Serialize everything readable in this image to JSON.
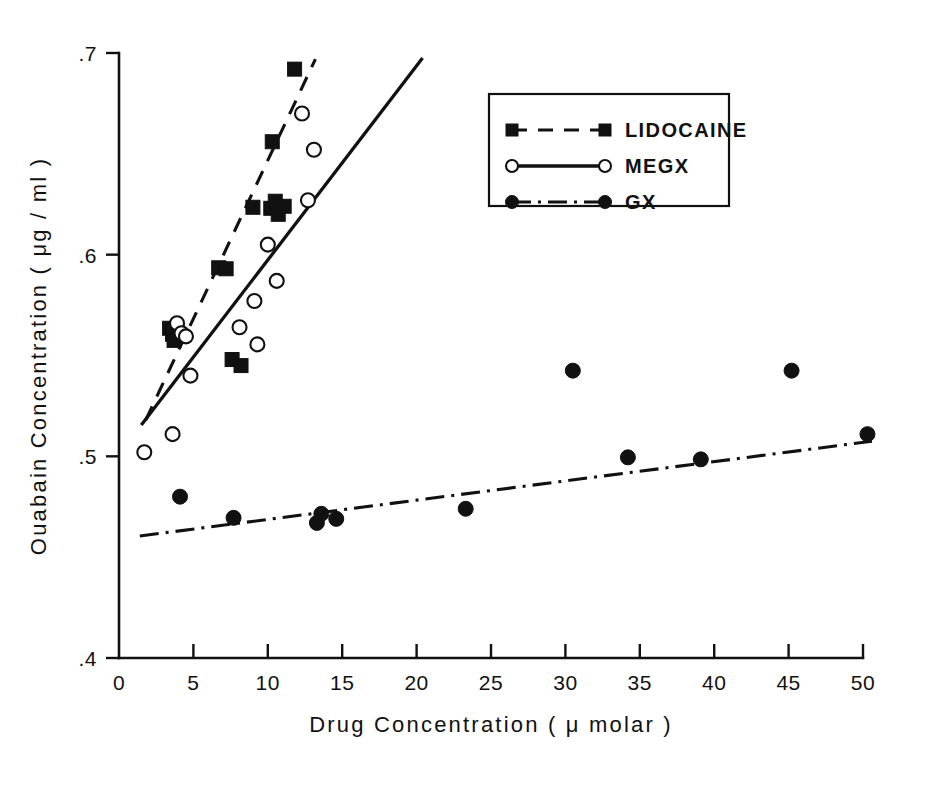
{
  "chart_data": {
    "type": "scatter",
    "title": "",
    "xlabel": "Drug Concentration ( μ molar )",
    "ylabel": "Ouabain Concentration ( μg / ml )",
    "xlim": [
      0,
      50
    ],
    "ylim": [
      0.4,
      0.7
    ],
    "xticks": [
      0,
      5,
      10,
      15,
      20,
      25,
      30,
      35,
      40,
      45,
      50
    ],
    "xtick_labels": [
      "0",
      "5",
      "10",
      "15",
      "20",
      "25",
      "30",
      "35",
      "40",
      "45",
      "50"
    ],
    "yticks": [
      0.4,
      0.5,
      0.6,
      0.7
    ],
    "ytick_labels": [
      ".4",
      ".5",
      ".6",
      ".7"
    ],
    "grid": false,
    "legend_position": "upper-right",
    "series": [
      {
        "name": "LIDOCAINE",
        "marker": "filled-square",
        "line_style": "dashed",
        "color": "#111111",
        "points": [
          {
            "x": 3.4,
            "y": 0.5635
          },
          {
            "x": 3.6,
            "y": 0.5605
          },
          {
            "x": 3.7,
            "y": 0.5575
          },
          {
            "x": 3.9,
            "y": 0.5615
          },
          {
            "x": 6.7,
            "y": 0.5935
          },
          {
            "x": 7.2,
            "y": 0.593
          },
          {
            "x": 7.6,
            "y": 0.548
          },
          {
            "x": 8.2,
            "y": 0.545
          },
          {
            "x": 9.0,
            "y": 0.6235
          },
          {
            "x": 10.2,
            "y": 0.623
          },
          {
            "x": 10.5,
            "y": 0.6265
          },
          {
            "x": 10.7,
            "y": 0.62
          },
          {
            "x": 11.1,
            "y": 0.624
          },
          {
            "x": 10.3,
            "y": 0.656
          },
          {
            "x": 11.8,
            "y": 0.692
          }
        ],
        "fit_line": {
          "x1": 1.8,
          "y1": 0.518,
          "x2": 13.2,
          "y2": 0.697
        }
      },
      {
        "name": "MEGX",
        "marker": "open-circle",
        "line_style": "solid",
        "color": "#111111",
        "points": [
          {
            "x": 1.7,
            "y": 0.502
          },
          {
            "x": 3.6,
            "y": 0.511
          },
          {
            "x": 3.9,
            "y": 0.566
          },
          {
            "x": 4.2,
            "y": 0.561
          },
          {
            "x": 4.5,
            "y": 0.5595
          },
          {
            "x": 4.8,
            "y": 0.54
          },
          {
            "x": 8.1,
            "y": 0.564
          },
          {
            "x": 9.3,
            "y": 0.5555
          },
          {
            "x": 9.1,
            "y": 0.577
          },
          {
            "x": 10.0,
            "y": 0.605
          },
          {
            "x": 10.6,
            "y": 0.587
          },
          {
            "x": 12.3,
            "y": 0.67
          },
          {
            "x": 13.1,
            "y": 0.652
          },
          {
            "x": 12.7,
            "y": 0.627
          }
        ],
        "fit_line": {
          "x1": 1.5,
          "y1": 0.5155,
          "x2": 20.4,
          "y2": 0.6975
        }
      },
      {
        "name": "GX",
        "marker": "filled-circle",
        "line_style": "dash-dot",
        "color": "#111111",
        "points": [
          {
            "x": 4.1,
            "y": 0.48
          },
          {
            "x": 7.7,
            "y": 0.4695
          },
          {
            "x": 13.3,
            "y": 0.467
          },
          {
            "x": 13.6,
            "y": 0.4715
          },
          {
            "x": 14.6,
            "y": 0.469
          },
          {
            "x": 23.3,
            "y": 0.474
          },
          {
            "x": 30.5,
            "y": 0.5425
          },
          {
            "x": 34.2,
            "y": 0.4995
          },
          {
            "x": 39.1,
            "y": 0.4985
          },
          {
            "x": 45.2,
            "y": 0.5425
          },
          {
            "x": 50.3,
            "y": 0.511
          }
        ],
        "fit_line": {
          "x1": 1.4,
          "y1": 0.4605,
          "x2": 50.6,
          "y2": 0.5075
        }
      }
    ]
  },
  "legend": {
    "items": [
      {
        "label": "LIDOCAINE",
        "marker": "filled-square",
        "line_style": "dashed"
      },
      {
        "label": "MEGX",
        "marker": "open-circle",
        "line_style": "solid"
      },
      {
        "label": "GX",
        "marker": "filled-circle",
        "line_style": "dash-dot"
      }
    ]
  },
  "axes": {
    "x_title": "Drug Concentration ( μ molar )",
    "y_title": "Ouabain Concentration ( μg / ml )"
  }
}
